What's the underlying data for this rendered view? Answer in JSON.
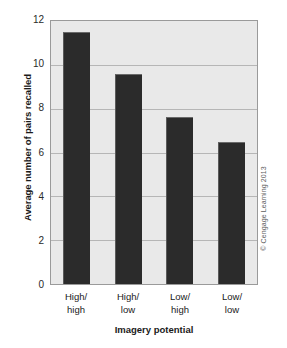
{
  "chart_data": {
    "type": "bar",
    "title": "",
    "subtitle": "",
    "categories": [
      "High/\nhigh",
      "High/\nlow",
      "Low/\nhigh",
      "Low/\nlow"
    ],
    "category_lines": [
      [
        "High/",
        "high"
      ],
      [
        "High/",
        "low"
      ],
      [
        "Low/",
        "high"
      ],
      [
        "Low/",
        "low"
      ]
    ],
    "values": [
      11.5,
      9.6,
      7.6,
      6.5
    ],
    "xlabel": "Imagery potential",
    "ylabel": "Average number of pairs recalled",
    "ylim": [
      0,
      12
    ],
    "ytick_values": [
      0,
      2,
      4,
      6,
      8,
      10,
      12
    ],
    "ytick_labels": [
      "0",
      "2",
      "4",
      "6",
      "8",
      "10",
      "12"
    ],
    "grid": true,
    "grid_axis": "y",
    "legend": null,
    "legend_position": "none",
    "bar_color": "#2b2b2b",
    "plot_background": "#e9e9e9",
    "grid_color": "#b6b6b6",
    "axis_color": "#9a9a9a",
    "page_background": "#ffffff"
  },
  "attribution": {
    "text": "© Cengage Learning 2013"
  }
}
